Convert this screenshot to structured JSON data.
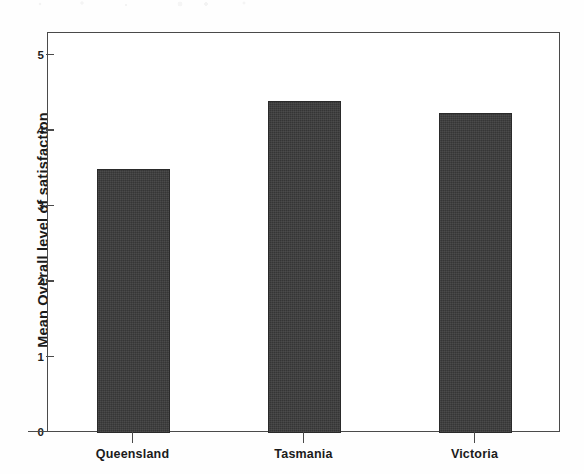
{
  "chart_data": {
    "type": "bar",
    "title": "",
    "xlabel": "",
    "ylabel": "Mean Overall level of satisfaction",
    "categories": [
      "Queensland",
      "Tasmania",
      "Victoria"
    ],
    "values": [
      3.5,
      4.4,
      4.25
    ],
    "ylim": [
      0,
      5
    ],
    "yticks": [
      0,
      1,
      2,
      3,
      4,
      5
    ],
    "ytick_labels": [
      "0",
      "1",
      "2",
      "3",
      "4",
      "5"
    ],
    "grid": false,
    "legend": false,
    "bar_color": "#3b3b3b",
    "axis_color": "#4a4a4a",
    "background_color": "#ffffff"
  },
  "axes": {
    "y_title": "Mean Overall level of satisfaction",
    "y_ticks": [
      {
        "label": "5",
        "value": 5
      },
      {
        "label": "4",
        "value": 4
      },
      {
        "label": "3",
        "value": 3
      },
      {
        "label": "2",
        "value": 2
      },
      {
        "label": "1",
        "value": 1
      },
      {
        "label": "0",
        "value": 0
      }
    ],
    "x_ticks": [
      {
        "label": "Queensland"
      },
      {
        "label": "Tasmania"
      },
      {
        "label": "Victoria"
      }
    ]
  },
  "bars": [
    {
      "category": "Queensland",
      "value": 3.5
    },
    {
      "category": "Tasmania",
      "value": 4.4
    },
    {
      "category": "Victoria",
      "value": 4.25
    }
  ]
}
